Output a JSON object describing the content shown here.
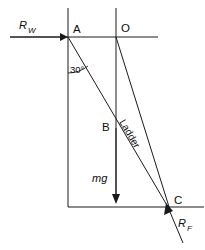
{
  "figure": {
    "type": "physics-free-body-diagram",
    "background_color": "#ffffff",
    "ink_color": "#1a1a1a"
  },
  "labels": {
    "reaction_wall": {
      "symbol": "R",
      "subscript": "W",
      "full": "R_W"
    },
    "point_a": "A",
    "point_o": "O",
    "point_b": "B",
    "point_c": "C",
    "angle": "30°",
    "ladder": "Ladder",
    "weight": "mg",
    "reaction_floor": {
      "symbol": "R",
      "subscript": "F",
      "full": "R_F"
    }
  },
  "geometry": {
    "wall_line_x": 68,
    "center_line_x": 116,
    "top_line_y": 37,
    "bottom_line_y": 207,
    "point_a": [
      68,
      37
    ],
    "point_o": [
      116,
      37
    ],
    "point_b": [
      116,
      128
    ],
    "point_c": [
      168,
      207
    ],
    "angle_value_degrees": 30
  },
  "forces": [
    {
      "name": "R_W",
      "direction": "rightward",
      "applied_at": "A"
    },
    {
      "name": "mg",
      "direction": "downward",
      "applied_at": "B"
    },
    {
      "name": "R_F",
      "direction": "up-and-left",
      "applied_at": "C"
    }
  ]
}
